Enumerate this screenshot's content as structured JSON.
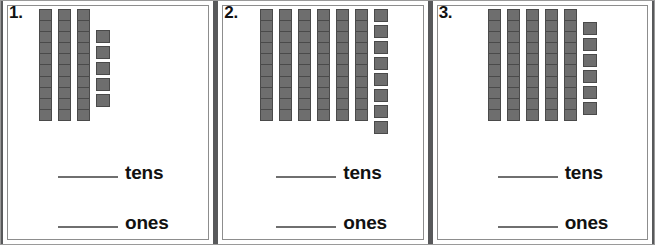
{
  "worksheet": {
    "title": "Tens and Ones Base-Ten Blocks Worksheet",
    "block_color": "#6e6e6e",
    "block_border_color": "#4a4a4a",
    "line_color": "#6f6f6f",
    "panel_divider_color": "#58595b"
  },
  "labels": {
    "tens": "tens",
    "ones": "ones",
    "blank": ""
  },
  "problems": [
    {
      "number": "1.",
      "tens_rods": 3,
      "units_per_rod": 10,
      "ones_cubes": 5,
      "tens_label": "tens",
      "ones_label": "ones",
      "tens_answer": "",
      "ones_answer": "",
      "total_value": 35
    },
    {
      "number": "2.",
      "tens_rods": 6,
      "units_per_rod": 10,
      "ones_cubes": 8,
      "tens_label": "tens",
      "ones_label": "ones",
      "tens_answer": "",
      "ones_answer": "",
      "total_value": 68
    },
    {
      "number": "3.",
      "tens_rods": 5,
      "units_per_rod": 10,
      "ones_cubes": 6,
      "tens_label": "tens",
      "ones_label": "ones",
      "tens_answer": "",
      "ones_answer": "",
      "total_value": 56
    }
  ]
}
